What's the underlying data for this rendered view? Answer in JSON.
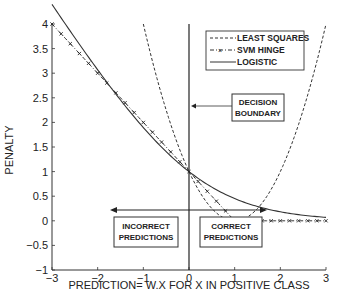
{
  "chart_data": {
    "type": "line",
    "title": "",
    "xlabel": "PREDICTION= W.X FOR X IN POSITIVE CLASS",
    "ylabel": "PENALTY",
    "xlim": [
      -3,
      3
    ],
    "ylim": [
      -1,
      4
    ],
    "xticks": [
      -3,
      -2,
      -1,
      0,
      1,
      2,
      3
    ],
    "yticks": [
      -1,
      -0.5,
      0,
      0.5,
      1,
      1.5,
      2,
      2.5,
      3,
      3.5,
      4
    ],
    "grid": false,
    "legend_position": "upper right",
    "series": [
      {
        "name": "LEAST SQUARES",
        "style": "dashed",
        "formula": "(1 - x)^2",
        "x": [
          -1,
          -0.5,
          0,
          0.5,
          1,
          1.5,
          2,
          2.5,
          3
        ],
        "values": [
          4,
          2.25,
          1,
          0.25,
          0,
          0.25,
          1,
          2.25,
          4
        ]
      },
      {
        "name": "SVM HINGE",
        "style": "dash-dot with x markers",
        "formula": "max(0, 1 - x)",
        "x": [
          -3,
          -2,
          -1,
          0,
          1,
          2,
          3
        ],
        "values": [
          4,
          3,
          2,
          1,
          0,
          0,
          0
        ]
      },
      {
        "name": "LOGISTIC",
        "style": "solid",
        "formula": "log(1 + exp(-x)) / log(2)",
        "x": [
          -3,
          -2,
          -1,
          0,
          1,
          2,
          3
        ],
        "values": [
          3.07,
          2.18,
          1.89,
          1.0,
          0.45,
          0.18,
          0.07
        ]
      }
    ],
    "annotations": [
      {
        "text": "DECISION BOUNDARY",
        "type": "vertical line at x=0 with arrow"
      },
      {
        "text": "INCORRECT PREDICTIONS",
        "region": "x < 0"
      },
      {
        "text": "CORRECT PREDICTIONS",
        "region": "x > 0"
      }
    ]
  },
  "labels": {
    "xlabel": "PREDICTION= W.X FOR X IN POSITIVE CLASS",
    "ylabel": "PENALTY",
    "legend": [
      "LEAST SQUARES",
      "SVM HINGE",
      "LOGISTIC"
    ],
    "decision_line1": "DECISION",
    "decision_line2": "BOUNDARY",
    "incorrect_line1": "INCORRECT",
    "incorrect_line2": "PREDICTIONS",
    "correct_line1": "CORRECT",
    "correct_line2": "PREDICTIONS"
  }
}
